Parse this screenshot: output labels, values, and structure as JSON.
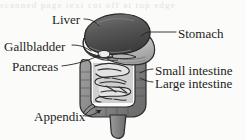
{
  "figure": {
    "style": "grayscale scanned textbook line illustration",
    "top_artifact_text": "scanned page text cut off at top edge",
    "labels": [
      {
        "id": "liver",
        "text": "Liver",
        "side": "left"
      },
      {
        "id": "stomach",
        "text": "Stomach",
        "side": "right"
      },
      {
        "id": "gallbladder",
        "text": "Gallbladder",
        "side": "left"
      },
      {
        "id": "pancreas",
        "text": "Pancreas",
        "side": "left"
      },
      {
        "id": "small_intestine",
        "text": "Small intestine",
        "side": "right"
      },
      {
        "id": "large_intestine",
        "text": "Large intestine",
        "side": "right"
      },
      {
        "id": "appendix",
        "text": "Appendix",
        "side": "left"
      }
    ],
    "colors": {
      "background": "#fbfbfa",
      "ink": "#232323",
      "liver_dark": "#4e4e4e",
      "liver_mid": "#6f6f6f",
      "stomach_light": "#c9c9c9",
      "colon_gray": "#8c8c8c",
      "small_intestine_fill": "#d8d8d8",
      "outline": "#2b2b2b"
    }
  }
}
